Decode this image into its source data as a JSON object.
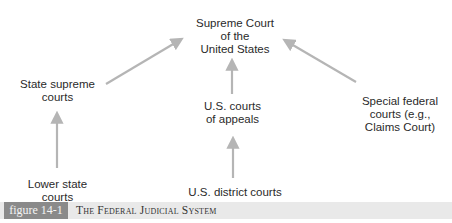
{
  "diagram": {
    "nodes": {
      "supreme_court": "Supreme Court\nof the\nUnited States",
      "state_supreme": "State supreme\ncourts",
      "courts_of_appeals": "U.S. courts\nof appeals",
      "special_federal": "Special federal\ncourts (e.g.,\nClaims Court)",
      "lower_state": "Lower state\ncourts",
      "district_courts": "U.S. district courts"
    },
    "edges": [
      {
        "from": "state_supreme",
        "to": "supreme_court"
      },
      {
        "from": "courts_of_appeals",
        "to": "supreme_court"
      },
      {
        "from": "special_federal",
        "to": "supreme_court"
      },
      {
        "from": "lower_state",
        "to": "state_supreme"
      },
      {
        "from": "district_courts",
        "to": "courts_of_appeals"
      }
    ],
    "arrow_color": "#b5b5b5"
  },
  "caption": {
    "figure_label": "figure 14-1",
    "title": "The Federal Judicial System"
  }
}
